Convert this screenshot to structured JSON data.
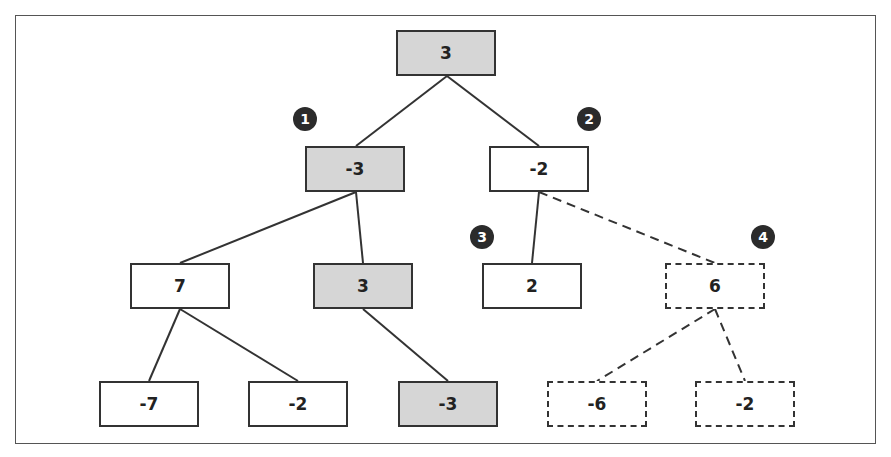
{
  "diagram": {
    "type": "minimax-tree",
    "nodes": [
      {
        "id": "root",
        "value": "3",
        "shaded": true,
        "dashed": false
      },
      {
        "id": "l1-left",
        "value": "-3",
        "shaded": true,
        "dashed": false
      },
      {
        "id": "l1-right",
        "value": "-2",
        "shaded": false,
        "dashed": false
      },
      {
        "id": "l2-a",
        "value": "7",
        "shaded": false,
        "dashed": false
      },
      {
        "id": "l2-b",
        "value": "3",
        "shaded": true,
        "dashed": false
      },
      {
        "id": "l2-c",
        "value": "2",
        "shaded": false,
        "dashed": false
      },
      {
        "id": "l2-d",
        "value": "6",
        "shaded": false,
        "dashed": true
      },
      {
        "id": "l3-a",
        "value": "-7",
        "shaded": false,
        "dashed": false
      },
      {
        "id": "l3-b",
        "value": "-2",
        "shaded": false,
        "dashed": false
      },
      {
        "id": "l3-c",
        "value": "-3",
        "shaded": true,
        "dashed": false
      },
      {
        "id": "l3-d",
        "value": "-6",
        "shaded": false,
        "dashed": true
      },
      {
        "id": "l3-e",
        "value": "-2",
        "shaded": false,
        "dashed": true
      }
    ],
    "edges": [
      {
        "from": "root",
        "to": "l1-left",
        "dashed": false
      },
      {
        "from": "root",
        "to": "l1-right",
        "dashed": false
      },
      {
        "from": "l1-left",
        "to": "l2-a",
        "dashed": false
      },
      {
        "from": "l1-left",
        "to": "l2-b",
        "dashed": false
      },
      {
        "from": "l1-right",
        "to": "l2-c",
        "dashed": false
      },
      {
        "from": "l1-right",
        "to": "l2-d",
        "dashed": true
      },
      {
        "from": "l2-a",
        "to": "l3-a",
        "dashed": false
      },
      {
        "from": "l2-a",
        "to": "l3-b",
        "dashed": false
      },
      {
        "from": "l2-b",
        "to": "l3-c",
        "dashed": false
      },
      {
        "from": "l2-d",
        "to": "l3-d",
        "dashed": true
      },
      {
        "from": "l2-d",
        "to": "l3-e",
        "dashed": true
      }
    ],
    "badges": [
      "1",
      "2",
      "3",
      "4"
    ],
    "colors": {
      "shaded_fill": "#d6d6d6",
      "border": "#333333",
      "badge_fill": "#2b2b2b"
    }
  }
}
